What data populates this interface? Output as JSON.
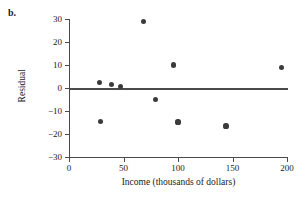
{
  "panel": {
    "label": "b."
  },
  "chart_data": {
    "type": "scatter",
    "title": "",
    "xlabel": "Income (thousands of dollars)",
    "ylabel": "Residual",
    "xlim": [
      0,
      200
    ],
    "ylim": [
      -30,
      30
    ],
    "grid": false,
    "legend": null,
    "reference_line": {
      "name": "zero-residual-line",
      "orientation": "horizontal",
      "y": 0
    },
    "xticks": [
      0,
      50,
      100,
      150,
      200
    ],
    "xtick_labels": [
      "0",
      "50",
      "100",
      "150",
      "200"
    ],
    "yticks": [
      30,
      20,
      10,
      0,
      -10,
      -20,
      -30
    ],
    "ytick_labels": [
      "30",
      "20",
      "10",
      "0",
      "−10",
      "−20",
      "−30"
    ],
    "points": [
      {
        "x": 28,
        "y": 2.5
      },
      {
        "x": 29,
        "y": -14.5
      },
      {
        "x": 39,
        "y": 1.5
      },
      {
        "x": 47,
        "y": 0.5
      },
      {
        "x": 68,
        "y": 29
      },
      {
        "x": 79,
        "y": -5
      },
      {
        "x": 96,
        "y": 10
      },
      {
        "x": 100,
        "y": -14.8
      },
      {
        "x": 144,
        "y": -16.5
      },
      {
        "x": 195,
        "y": 9
      }
    ],
    "marker": {
      "shape": "circle",
      "color": "#3b3b3b",
      "size": 5
    },
    "axis_color": "#4a4a4a"
  }
}
